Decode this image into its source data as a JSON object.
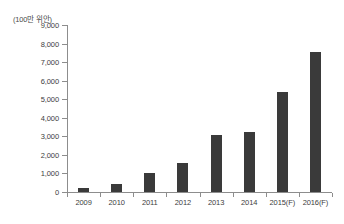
{
  "chart_data": {
    "type": "bar",
    "title": "",
    "subtitle": "",
    "unit_caption": "(100만 위안)",
    "xlabel": "",
    "ylabel": "",
    "categories": [
      "2009",
      "2010",
      "2011",
      "2012",
      "2013",
      "2014",
      "2015(F)",
      "2016(F)"
    ],
    "values": [
      200,
      450,
      1050,
      1550,
      3050,
      3250,
      5400,
      7550
    ],
    "series": [
      {
        "name": "",
        "values": [
          200,
          450,
          1050,
          1550,
          3050,
          3250,
          5400,
          7550
        ]
      }
    ],
    "ylim": [
      0,
      9000
    ],
    "y_ticks": [
      0,
      1000,
      2000,
      3000,
      4000,
      5000,
      6000,
      7000,
      8000,
      9000
    ],
    "y_tick_labels": [
      "0",
      "1,000",
      "2,000",
      "3,000",
      "4,000",
      "5,000",
      "6,000",
      "7,000",
      "8,000",
      "9,000"
    ],
    "grid": false,
    "legend": false,
    "legend_position": "none",
    "bar_color": "#3a3a3a",
    "axis_color": "#8d8d8d",
    "text_color": "#3d3d3d"
  }
}
